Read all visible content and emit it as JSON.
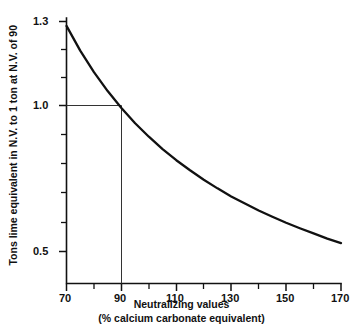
{
  "chart_data": {
    "type": "line",
    "title": "",
    "xlabel": "Neutralizing values\n(% calcium carbonate equivalent)",
    "xlabel_line1": "Neutralizing values",
    "xlabel_line2": "(% calcium carbonate equivalent)",
    "ylabel": "Tons lime equivalent in N.V. to 1 ton at N.V. of 90",
    "xlim": [
      70,
      170
    ],
    "ylim": [
      0.44,
      1.3
    ],
    "grid": false,
    "legend": null,
    "x_tick_labels": [
      "70",
      "90",
      "110",
      "130",
      "150",
      "170"
    ],
    "x_major_ticks": [
      70,
      90,
      110,
      130,
      150,
      170
    ],
    "x_minor_ticks": [
      80,
      100,
      120,
      140,
      160
    ],
    "y_tick_labels": [
      "1.3",
      "1.0",
      "0.5"
    ],
    "y_major_ticks": [
      1.3,
      1.0,
      0.5
    ],
    "y_minor_ticks": [
      1.2,
      1.1,
      0.9,
      0.8,
      0.7,
      0.6
    ],
    "series": [
      {
        "name": "Tons lime equivalent",
        "relation": "y = 90 / x",
        "x": [
          70,
          75,
          80,
          85,
          90,
          95,
          100,
          105,
          110,
          115,
          120,
          125,
          130,
          135,
          140,
          145,
          150,
          155,
          160,
          165,
          170
        ],
        "values": [
          1.286,
          1.2,
          1.125,
          1.059,
          1.0,
          0.947,
          0.9,
          0.857,
          0.818,
          0.783,
          0.75,
          0.72,
          0.692,
          0.667,
          0.643,
          0.621,
          0.6,
          0.581,
          0.563,
          0.545,
          0.529
        ]
      }
    ],
    "annotations": [
      {
        "name": "reference-lines",
        "description": "Horizontal reference line from y-axis to x=90 at y=1.0, and vertical reference line from x=90 down to x-axis",
        "x": 90,
        "y": 1.0
      }
    ],
    "colors": {
      "curve": "#111111",
      "axis": "#111111",
      "reference": "#333333",
      "background": "#ffffff"
    }
  }
}
